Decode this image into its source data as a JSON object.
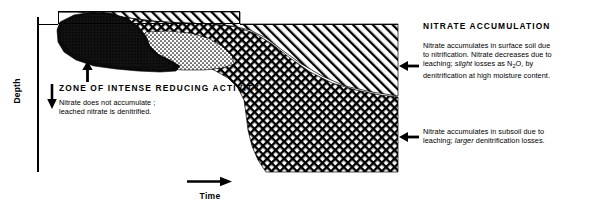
{
  "figure": {
    "type": "soil-profile-schematic",
    "axes": {
      "y_label": "Depth",
      "y_direction": "downward",
      "x_label": "Time",
      "x_direction": "rightward"
    },
    "zones": [
      {
        "id": "reducing-zone",
        "pattern": "solid-black",
        "position": "upper-left"
      },
      {
        "id": "transition-zone",
        "pattern": "stipple",
        "position": "upper-middle"
      },
      {
        "id": "crosshatch-zone",
        "pattern": "cross-hatch",
        "position": "middle-lower"
      },
      {
        "id": "diagonal-zone",
        "pattern": "diagonal-hatch",
        "position": "upper-right"
      }
    ]
  },
  "annotations": {
    "nitrate_accumulation": {
      "title": "NITRATE  ACCUMULATION",
      "line1": "Nitrate accumulates in surface soil due",
      "line2_a": "to nitrification. Nitrate decreases due to",
      "line3_a": "leaching; ",
      "line3_i": "slight",
      "line3_b": " losses as N",
      "line3_sub": "2",
      "line3_c": "O, by",
      "line4": "denitrification at high moisture content."
    },
    "subsoil": {
      "line1": "Nitrate accumulates in subsoil due to",
      "line2_a": "leaching; ",
      "line2_i": "larger",
      "line2_b": " denitrification losses."
    },
    "reducing_zone": {
      "title": "ZONE  OF  INTENSE  REDUCING  ACTIVITY",
      "line1": "Nitrate does not accumulate ;",
      "line2": "leached nitrate is denitrified."
    }
  },
  "colors": {
    "ink": "#000000",
    "background": "#ffffff",
    "stipple": "#8a8a8a"
  }
}
